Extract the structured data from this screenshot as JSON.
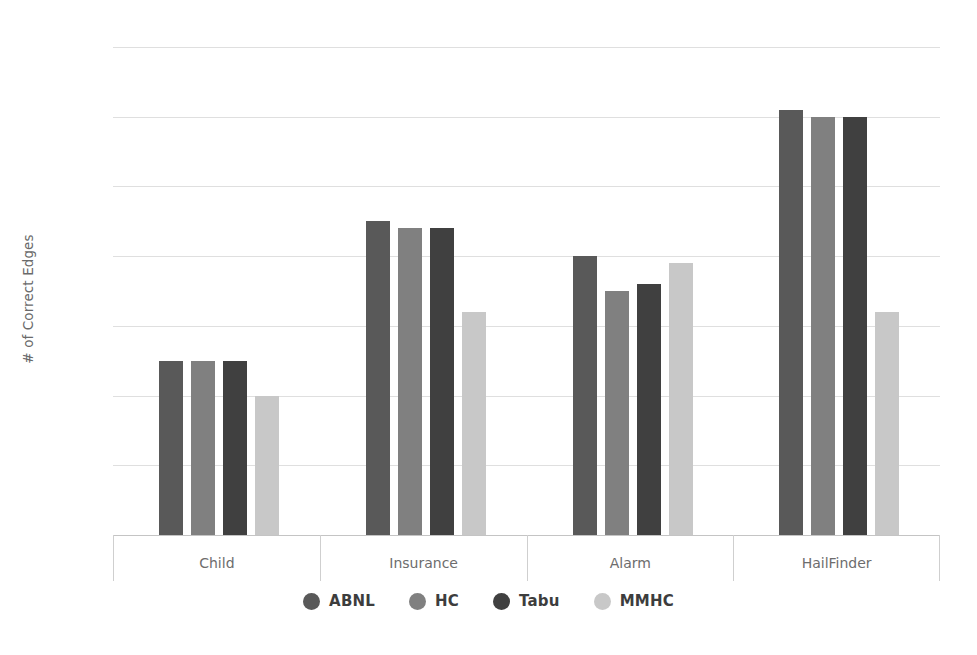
{
  "chart_data": {
    "type": "bar",
    "title": "",
    "subtitle": "",
    "xlabel": "",
    "ylabel": "# of Correct Edges",
    "categories": [
      "Child",
      "Insurance",
      "Alarm",
      "HailFinder"
    ],
    "series": [
      {
        "name": "ABNL",
        "color": "#595959",
        "values": [
          25,
          45,
          40,
          61
        ]
      },
      {
        "name": "HC",
        "color": "#808080",
        "values": [
          25,
          44,
          35,
          60
        ]
      },
      {
        "name": "Tabu",
        "color": "#404040",
        "values": [
          25,
          44,
          36,
          60
        ]
      },
      {
        "name": "MMHC",
        "color": "#c8c8c8",
        "values": [
          20,
          32,
          39,
          32
        ]
      }
    ],
    "ylim": [
      0,
      70
    ],
    "ytick_step": 10,
    "ytick_labels": [
      "70",
      "60",
      "50",
      "40",
      "30",
      "20",
      "10",
      "0"
    ],
    "ytick_values": [
      70,
      60,
      50,
      40,
      30,
      20,
      10,
      0
    ],
    "grid": true,
    "grid_axis": "y",
    "legend_position": "bottom",
    "legend_marker": "circle",
    "background_color": "#ffffff",
    "gridline_color": "#dfdfdf",
    "axis_color": "#c4c4c4",
    "tick_label_color": "#777777"
  }
}
